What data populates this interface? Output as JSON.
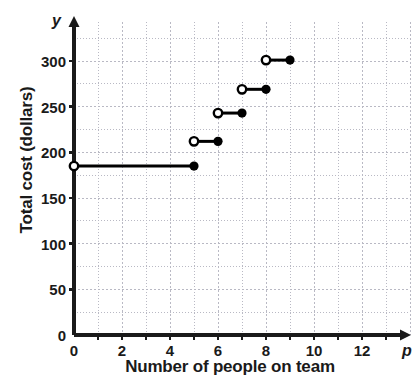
{
  "chart_data": {
    "type": "line",
    "title": "",
    "subtitle": "",
    "xlabel": "Number of people on team",
    "ylabel": "Total cost (dollars)",
    "x_axis_variable": "p",
    "y_axis_variable": "y",
    "xlim": [
      0,
      14
    ],
    "ylim": [
      0,
      325
    ],
    "xticks": [
      0,
      2,
      4,
      6,
      8,
      10,
      12
    ],
    "xtick_labels": [
      "0",
      "2",
      "4",
      "6",
      "8",
      "10",
      "12"
    ],
    "yticks": [
      0,
      50,
      100,
      150,
      200,
      250,
      300
    ],
    "ytick_labels": [
      "0",
      "50",
      "100",
      "150",
      "200",
      "250",
      "300"
    ],
    "grid": true,
    "grid_minor_x_step": 1,
    "grid_minor_y_step": 25,
    "legend": "none",
    "series": [
      {
        "name": "Total cost step function",
        "style": "step",
        "segments": [
          {
            "x_start": 0,
            "x_end": 5,
            "y": 185,
            "left_endpoint": "open",
            "right_endpoint": "closed"
          },
          {
            "x_start": 5,
            "x_end": 6,
            "y": 212,
            "left_endpoint": "open",
            "right_endpoint": "closed"
          },
          {
            "x_start": 6,
            "x_end": 7,
            "y": 243,
            "left_endpoint": "open",
            "right_endpoint": "closed"
          },
          {
            "x_start": 7,
            "x_end": 8,
            "y": 269,
            "left_endpoint": "open",
            "right_endpoint": "closed"
          },
          {
            "x_start": 8,
            "x_end": 9,
            "y": 301,
            "left_endpoint": "open",
            "right_endpoint": "closed"
          }
        ]
      }
    ],
    "colors": {
      "line": "#000000",
      "grid": "#b9b9c4",
      "axis": "#1a1a1a",
      "text": "#1a1a1a",
      "background": "#ffffff"
    }
  }
}
